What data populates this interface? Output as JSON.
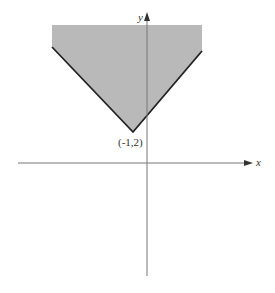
{
  "diagram": {
    "type": "shaded_region_graph",
    "axes": {
      "x_label": "x",
      "y_label": "y"
    },
    "vertex": {
      "label": "(-1,2)",
      "x": -1,
      "y": 2
    },
    "colors": {
      "shade": "#b9b9b9",
      "boundary": "#222222",
      "axis": "#777777",
      "label": "#333333"
    }
  }
}
